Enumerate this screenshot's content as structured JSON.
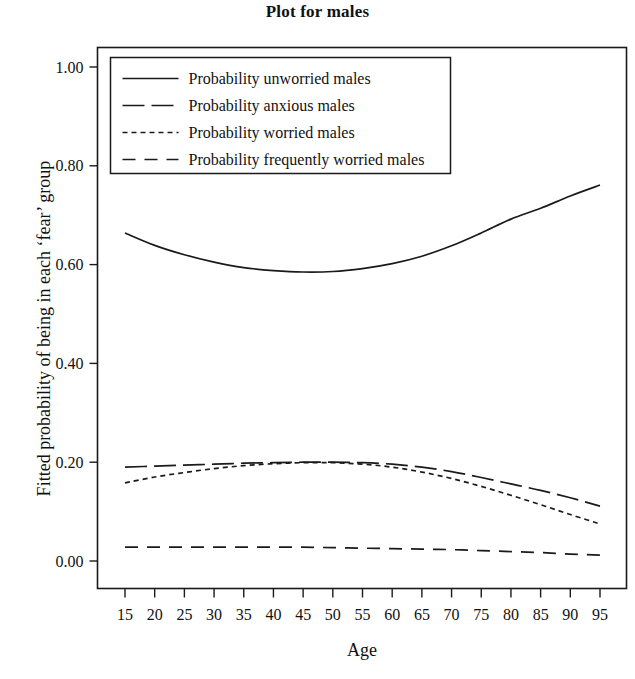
{
  "chart_data": {
    "type": "line",
    "title": "Plot for males",
    "xlabel": "Age",
    "ylabel": "Fitted probability of being in each ‘fear’ group",
    "xlim": [
      15,
      95
    ],
    "ylim": [
      0.0,
      1.0
    ],
    "grid": false,
    "legend_position": "top-left-inside",
    "xticklabels": [
      "15",
      "20",
      "25",
      "30",
      "35",
      "40",
      "45",
      "50",
      "55",
      "60",
      "65",
      "70",
      "75",
      "80",
      "85",
      "90",
      "95"
    ],
    "yticklabels": [
      "0.00",
      "0.20",
      "0.40",
      "0.60",
      "0.80",
      "1.00"
    ],
    "x": [
      15,
      20,
      25,
      30,
      35,
      40,
      45,
      50,
      55,
      60,
      65,
      70,
      75,
      80,
      85,
      90,
      95
    ],
    "series": [
      {
        "name": "Probability unworried males",
        "dash": "solid",
        "values": [
          0.664,
          0.639,
          0.62,
          0.605,
          0.594,
          0.588,
          0.585,
          0.586,
          0.592,
          0.602,
          0.617,
          0.638,
          0.664,
          0.692,
          0.714,
          0.739,
          0.761
        ]
      },
      {
        "name": "Probability anxious males",
        "dash": "long-dash",
        "values": [
          0.19,
          0.192,
          0.194,
          0.196,
          0.198,
          0.199,
          0.2,
          0.2,
          0.199,
          0.196,
          0.19,
          0.181,
          0.169,
          0.156,
          0.143,
          0.128,
          0.111
        ]
      },
      {
        "name": "Probability worried males",
        "dash": "dotted",
        "values": [
          0.158,
          0.17,
          0.179,
          0.187,
          0.193,
          0.197,
          0.199,
          0.199,
          0.196,
          0.19,
          0.18,
          0.167,
          0.151,
          0.133,
          0.114,
          0.094,
          0.075
        ]
      },
      {
        "name": "Probability frequently worried males",
        "dash": "dashed",
        "values": [
          0.028,
          0.028,
          0.028,
          0.028,
          0.028,
          0.028,
          0.028,
          0.027,
          0.026,
          0.025,
          0.024,
          0.023,
          0.021,
          0.019,
          0.017,
          0.014,
          0.012
        ]
      }
    ]
  },
  "legend": {
    "items": [
      {
        "label": "Probability unworried males"
      },
      {
        "label": "Probability anxious males"
      },
      {
        "label": "Probability worried males"
      },
      {
        "label": "Probability frequently worried males"
      }
    ]
  }
}
